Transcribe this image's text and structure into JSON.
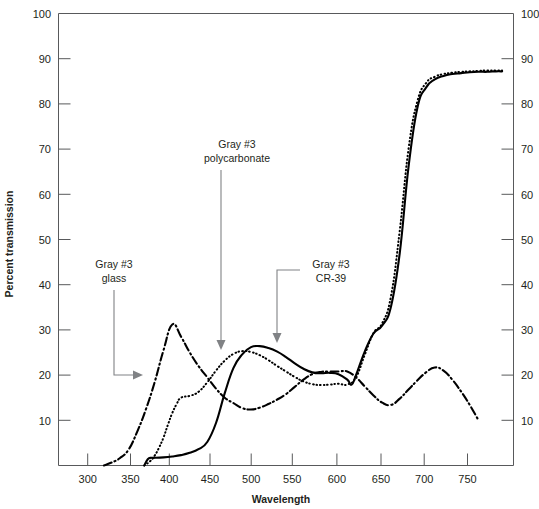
{
  "chart_data": {
    "type": "line",
    "title": "",
    "xlabel": "Wavelength",
    "ylabel": "Percent transmission",
    "xlim": [
      270,
      790
    ],
    "ylim": [
      0,
      100
    ],
    "grid": false,
    "legend_position": "inline-annotations",
    "x_ticks": [
      300,
      350,
      400,
      450,
      500,
      550,
      600,
      650,
      700,
      750
    ],
    "y_ticks": [
      0,
      10,
      20,
      30,
      40,
      50,
      60,
      70,
      80,
      90,
      100
    ],
    "y_axis_left_labels": [
      "100",
      "90",
      "80",
      "70",
      "60",
      "50",
      "40",
      "30",
      "20",
      "10"
    ],
    "y_axis_right_labels": [
      "100",
      "90",
      "80",
      "70",
      "60",
      "50",
      "40",
      "30",
      "20",
      "10"
    ],
    "x_tick_labels": [
      "300",
      "350",
      "400",
      "450",
      "500",
      "550",
      "600",
      "650",
      "700",
      "750"
    ],
    "series": [
      {
        "name": "Gray #3 glass",
        "style": "dash-dot",
        "x": [
          322,
          330,
          340,
          350,
          360,
          370,
          380,
          390,
          400,
          410,
          420,
          430,
          440,
          450,
          460,
          470,
          480,
          490,
          500,
          510,
          520,
          530,
          540,
          550,
          560,
          570,
          580,
          590,
          600,
          610,
          620,
          630,
          640,
          650,
          660,
          670,
          680,
          690,
          700,
          710,
          720,
          730,
          740,
          750
        ],
        "y": [
          0,
          0.6,
          1.6,
          3.5,
          7.5,
          12.5,
          18.5,
          25.5,
          31.2,
          28.5,
          25.0,
          22.0,
          19.5,
          17.0,
          15.0,
          13.8,
          12.7,
          12.4,
          12.8,
          13.6,
          14.6,
          15.8,
          17.4,
          19.0,
          20.2,
          20.7,
          20.8,
          20.8,
          20.8,
          19.5,
          17.5,
          15.5,
          13.9,
          13.4,
          14.8,
          16.8,
          18.8,
          20.6,
          21.7,
          21.0,
          19.0,
          16.4,
          13.4,
          10.0
        ]
      },
      {
        "name": "Gray #3 polycarbonate",
        "style": "dotted",
        "x": [
          368,
          375,
          380,
          385,
          390,
          395,
          400,
          405,
          410,
          420,
          430,
          440,
          450,
          460,
          470,
          480,
          490,
          500,
          510,
          520,
          530,
          540,
          550,
          560,
          570,
          580,
          590,
          600,
          610,
          620,
          630,
          640,
          650,
          660,
          670,
          680,
          690,
          700,
          710,
          720,
          730,
          740,
          750,
          760,
          770,
          777
        ],
        "y": [
          0,
          1.0,
          2.2,
          4.0,
          6.2,
          9.0,
          11.6,
          13.6,
          15.0,
          15.4,
          16.3,
          18.4,
          21.0,
          23.2,
          24.7,
          25.3,
          25.1,
          24.4,
          23.3,
          22.0,
          20.8,
          19.6,
          18.6,
          18.0,
          17.8,
          17.9,
          18.1,
          17.9,
          19.5,
          24.5,
          29.3,
          31.5,
          37.5,
          52.0,
          70.0,
          80.5,
          84.6,
          86.0,
          86.6,
          86.9,
          87.1,
          87.2,
          87.3,
          87.4,
          87.4,
          87.4
        ]
      },
      {
        "name": "Gray #3 CR-39",
        "style": "solid",
        "x": [
          368,
          372,
          376,
          380,
          390,
          400,
          410,
          420,
          430,
          440,
          450,
          460,
          470,
          480,
          490,
          500,
          510,
          520,
          530,
          540,
          550,
          560,
          570,
          580,
          590,
          600,
          605,
          610,
          620,
          630,
          640,
          650,
          660,
          670,
          680,
          690,
          700,
          710,
          720,
          730,
          740,
          750,
          760,
          770,
          777
        ],
        "y": [
          0,
          1.4,
          1.7,
          1.7,
          1.8,
          2.0,
          2.3,
          2.8,
          3.6,
          5.2,
          9.4,
          16.0,
          21.6,
          24.6,
          26.2,
          26.4,
          26.0,
          25.2,
          24.0,
          22.6,
          21.4,
          20.6,
          20.4,
          20.5,
          20.2,
          19.0,
          17.9,
          20.0,
          25.2,
          29.2,
          31.0,
          35.2,
          47.0,
          66.0,
          79.0,
          83.6,
          85.4,
          86.2,
          86.6,
          86.8,
          87.0,
          87.1,
          87.1,
          87.2,
          87.2
        ]
      }
    ],
    "annotations": [
      {
        "id": "annot-glass",
        "lines": [
          "Gray #3",
          "glass"
        ],
        "text_x": 114,
        "text_y": 264,
        "target_x": 143,
        "target_y": 366
      },
      {
        "id": "annot-polycarbonate",
        "lines": [
          "Gray #3",
          "polycarbonate"
        ],
        "text_x": 228,
        "text_y": 146,
        "target_x": 221,
        "target_y": 350
      },
      {
        "id": "annot-cr39",
        "lines": [
          "Gray #3",
          "CR-39"
        ],
        "text_x": 329,
        "text_y": 266,
        "target_x": 277,
        "target_y": 343
      }
    ]
  }
}
